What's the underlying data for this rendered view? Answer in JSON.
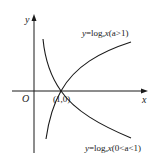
{
  "diagram": {
    "title": "",
    "axes": {
      "x_label": "x",
      "y_label": "y",
      "origin_label": "O"
    },
    "point": {
      "label": "(1,0)"
    },
    "curves": [
      {
        "name": "increasing",
        "label_y": "y",
        "label_eq": "=log",
        "label_base": "a",
        "label_x": "x",
        "label_cond": "(a>1)"
      },
      {
        "name": "decreasing",
        "label_y": "y",
        "label_eq": "=log",
        "label_base": "a",
        "label_x": "x",
        "label_cond": "(0<a<1)"
      }
    ],
    "colors": {
      "stroke": "#1a1a1a",
      "background": "#ffffff"
    }
  }
}
